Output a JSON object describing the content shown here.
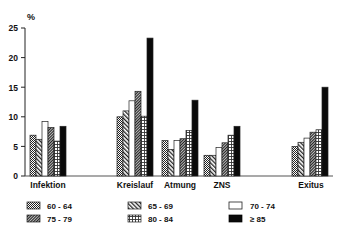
{
  "chart_data": {
    "type": "bar",
    "title": "",
    "ylabel": "%",
    "xlabel": "",
    "ylim": [
      0,
      25
    ],
    "yticks": [
      0,
      5,
      10,
      15,
      20,
      25
    ],
    "grid": false,
    "legend_position": "bottom",
    "categories": [
      "Infektion",
      "Kreislauf",
      "Atmung",
      "ZNS",
      "Exitus"
    ],
    "series": [
      {
        "name": "60 - 64",
        "pattern": "crosshatch-dark",
        "values": [
          6.9,
          10.0,
          6.0,
          3.5,
          5.0
        ]
      },
      {
        "name": "65 - 69",
        "pattern": "diagonal-stripes",
        "values": [
          6.2,
          11.0,
          4.5,
          3.5,
          5.7
        ]
      },
      {
        "name": "70 - 74",
        "pattern": "white",
        "values": [
          9.2,
          12.7,
          6.0,
          4.8,
          6.4
        ]
      },
      {
        "name": "75 - 79",
        "pattern": "diagonal-dense",
        "values": [
          8.2,
          14.3,
          6.3,
          5.6,
          7.4
        ]
      },
      {
        "name": "80 - 84",
        "pattern": "grid-dotted",
        "values": [
          5.9,
          10.1,
          7.7,
          6.9,
          7.8
        ]
      },
      {
        "name": "≥ 85",
        "pattern": "solid-black",
        "values": [
          8.4,
          23.3,
          12.8,
          8.4,
          15.0
        ]
      }
    ]
  },
  "axis": {
    "unit": "%",
    "ticks": [
      "0",
      "5",
      "10",
      "15",
      "20",
      "25"
    ]
  },
  "categories": {
    "c0": "Infektion",
    "c1": "Kreislauf",
    "c2": "Atmung",
    "c3": "ZNS",
    "c4": "Exitus"
  },
  "legend": {
    "l0": "60 - 64",
    "l1": "65 - 69",
    "l2": "70 - 74",
    "l3": "75 - 79",
    "l4": "80 - 84",
    "l5": "≥ 85"
  }
}
